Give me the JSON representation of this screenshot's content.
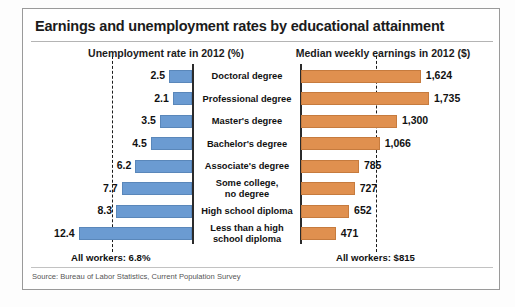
{
  "chart": {
    "title": "Earnings and unemployment rates by educational attainment",
    "left_subtitle": "Unemployment rate in 2012 (%)",
    "right_subtitle": "Median weekly earnings in 2012 ($)",
    "left_average_note": "All workers: 6.8%",
    "right_average_note": "All workers: $815",
    "source": "Source: Bureau of Labor Statistics, Current Population Survey",
    "colors": {
      "unemployment_bar": "#6b9bd2",
      "earnings_bar": "#e0904f",
      "axis": "#2b2b2b",
      "text": "#111111",
      "card_border": "#9a9a9a"
    }
  },
  "chart_data": {
    "type": "bar",
    "title": "Earnings and unemployment rates by educational attainment",
    "subtitle": "",
    "layout": "diverging-bidirectional-bar",
    "grid": false,
    "legend": "none",
    "categories": [
      "Doctoral degree",
      "Professional degree",
      "Master's degree",
      "Bachelor's degree",
      "Associate's degree",
      "Some college, no degree",
      "High school diploma",
      "Less than a high school diploma"
    ],
    "category_lines": [
      [
        "Doctoral degree"
      ],
      [
        "Professional degree"
      ],
      [
        "Master's degree"
      ],
      [
        "Bachelor's degree"
      ],
      [
        "Associate's degree"
      ],
      [
        "Some college,",
        "no degree"
      ],
      [
        "High school diploma"
      ],
      [
        "Less than a high",
        "school diploma"
      ]
    ],
    "series": [
      {
        "name": "Unemployment rate in 2012 (%)",
        "direction": "left",
        "unit": "%",
        "color": "#6b9bd2",
        "values": [
          2.5,
          2.1,
          3.5,
          4.5,
          6.2,
          7.7,
          8.3,
          12.4
        ],
        "labels": [
          "2.5",
          "2.1",
          "3.5",
          "4.5",
          "6.2",
          "7.7",
          "8.3",
          "12.4"
        ],
        "reference_line": {
          "value": 6.8,
          "label": "All workers: 6.8%"
        },
        "axis_max": 13.0
      },
      {
        "name": "Median weekly earnings in 2012 ($)",
        "direction": "right",
        "unit": "$",
        "color": "#e0904f",
        "values": [
          1624,
          1735,
          1300,
          1066,
          785,
          727,
          652,
          471
        ],
        "labels": [
          "1,624",
          "1,735",
          "1,300",
          "1,066",
          "785",
          "727",
          "652",
          "471"
        ],
        "reference_line": {
          "value": 815,
          "label": "All workers: $815"
        },
        "axis_max": 1820
      }
    ],
    "xlabel": "",
    "ylabel": ""
  }
}
